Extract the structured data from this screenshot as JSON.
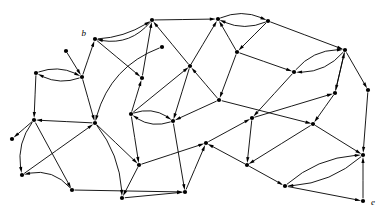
{
  "figure": {
    "type": "directed-graph-diagram",
    "background_color": "#ffffff",
    "ink_color": "#000000",
    "width": 388,
    "height": 218,
    "node_radius": 2.1,
    "arrow_length": 6.0,
    "arrow_width": 3.2,
    "stroke_width": 0.9
  },
  "labels": [
    {
      "id": "lbl-b",
      "text": "b",
      "node": "n01",
      "x": 86,
      "y": 36,
      "anchor": "end"
    },
    {
      "id": "lbl-e",
      "text": "e",
      "node": "n33",
      "x": 371,
      "y": 205,
      "anchor": "start"
    }
  ],
  "nodes": [
    {
      "id": "n01",
      "x": 95,
      "y": 39
    },
    {
      "id": "n02",
      "x": 152,
      "y": 20
    },
    {
      "id": "n03",
      "x": 218,
      "y": 19
    },
    {
      "id": "n04",
      "x": 268,
      "y": 21
    },
    {
      "id": "n05",
      "x": 36,
      "y": 73
    },
    {
      "id": "n06",
      "x": 82,
      "y": 77
    },
    {
      "id": "n07",
      "x": 142,
      "y": 78
    },
    {
      "id": "n08",
      "x": 190,
      "y": 66
    },
    {
      "id": "n09",
      "x": 237,
      "y": 52
    },
    {
      "id": "n10",
      "x": 294,
      "y": 72
    },
    {
      "id": "n11",
      "x": 345,
      "y": 50
    },
    {
      "id": "n12",
      "x": 34,
      "y": 120
    },
    {
      "id": "n13",
      "x": 95,
      "y": 123
    },
    {
      "id": "n14",
      "x": 131,
      "y": 114
    },
    {
      "id": "n15",
      "x": 173,
      "y": 121
    },
    {
      "id": "n16",
      "x": 219,
      "y": 100
    },
    {
      "id": "n17",
      "x": 252,
      "y": 118
    },
    {
      "id": "n18",
      "x": 335,
      "y": 93
    },
    {
      "id": "n19",
      "x": 368,
      "y": 90
    },
    {
      "id": "n20",
      "x": 313,
      "y": 124
    },
    {
      "id": "n21",
      "x": 22,
      "y": 175
    },
    {
      "id": "n22",
      "x": 72,
      "y": 190
    },
    {
      "id": "n23",
      "x": 139,
      "y": 165
    },
    {
      "id": "n24",
      "x": 122,
      "y": 198
    },
    {
      "id": "n25",
      "x": 185,
      "y": 192
    },
    {
      "id": "n26",
      "x": 206,
      "y": 143
    },
    {
      "id": "n27",
      "x": 247,
      "y": 165
    },
    {
      "id": "n28",
      "x": 285,
      "y": 186
    },
    {
      "id": "n29",
      "x": 363,
      "y": 155
    },
    {
      "id": "n30",
      "x": 66,
      "y": 51
    },
    {
      "id": "n31",
      "x": 12,
      "y": 139
    },
    {
      "id": "n32",
      "x": 162,
      "y": 47
    },
    {
      "id": "n33",
      "x": 363,
      "y": 201
    }
  ],
  "edges": [
    {
      "from": "n02",
      "to": "n01",
      "curve": -20
    },
    {
      "from": "n01",
      "to": "n02",
      "curve": 9
    },
    {
      "from": "n02",
      "to": "n03",
      "curve": 0
    },
    {
      "from": "n03",
      "to": "n04",
      "curve": -13
    },
    {
      "from": "n04",
      "to": "n03",
      "curve": -13
    },
    {
      "from": "n05",
      "to": "n06",
      "curve": -12
    },
    {
      "from": "n06",
      "to": "n05",
      "curve": -12
    },
    {
      "from": "n06",
      "to": "n01",
      "curve": 0
    },
    {
      "from": "n01",
      "to": "n07",
      "curve": 0
    },
    {
      "from": "n07",
      "to": "n02",
      "curve": 0
    },
    {
      "from": "n08",
      "to": "n02",
      "curve": 0
    },
    {
      "from": "n08",
      "to": "n03",
      "curve": 0
    },
    {
      "from": "n09",
      "to": "n03",
      "curve": 0
    },
    {
      "from": "n04",
      "to": "n09",
      "curve": 0
    },
    {
      "from": "n04",
      "to": "n11",
      "curve": 0
    },
    {
      "from": "n09",
      "to": "n10",
      "curve": 0
    },
    {
      "from": "n10",
      "to": "n11",
      "curve": -15
    },
    {
      "from": "n11",
      "to": "n10",
      "curve": -15
    },
    {
      "from": "n05",
      "to": "n12",
      "curve": 0
    },
    {
      "from": "n06",
      "to": "n13",
      "curve": 0
    },
    {
      "from": "n14",
      "to": "n08",
      "curve": 0
    },
    {
      "from": "n14",
      "to": "n07",
      "curve": 0
    },
    {
      "from": "n14",
      "to": "n15",
      "curve": -13
    },
    {
      "from": "n15",
      "to": "n14",
      "curve": -13
    },
    {
      "from": "n08",
      "to": "n15",
      "curve": 0
    },
    {
      "from": "n16",
      "to": "n08",
      "curve": 0
    },
    {
      "from": "n09",
      "to": "n16",
      "curve": 0
    },
    {
      "from": "n16",
      "to": "n15",
      "curve": 0
    },
    {
      "from": "n10",
      "to": "n17",
      "curve": 0
    },
    {
      "from": "n11",
      "to": "n18",
      "curve": 0
    },
    {
      "from": "n11",
      "to": "n19",
      "curve": 0
    },
    {
      "from": "n18",
      "to": "n11",
      "curve": 0
    },
    {
      "from": "n18",
      "to": "n20",
      "curve": 0
    },
    {
      "from": "n17",
      "to": "n18",
      "curve": 0
    },
    {
      "from": "n12",
      "to": "n21",
      "curve": 14
    },
    {
      "from": "n12",
      "to": "n22",
      "curve": 0
    },
    {
      "from": "n13",
      "to": "n12",
      "curve": 0
    },
    {
      "from": "n13",
      "to": "n23",
      "curve": 0
    },
    {
      "from": "n21",
      "to": "n13",
      "curve": 0
    },
    {
      "from": "n22",
      "to": "n21",
      "curve": 18
    },
    {
      "from": "n13",
      "to": "n24",
      "curve": -14
    },
    {
      "from": "n14",
      "to": "n23",
      "curve": 0
    },
    {
      "from": "n23",
      "to": "n26",
      "curve": 0
    },
    {
      "from": "n15",
      "to": "n25",
      "curve": 0
    },
    {
      "from": "n23",
      "to": "n24",
      "curve": 0
    },
    {
      "from": "n24",
      "to": "n25",
      "curve": 0
    },
    {
      "from": "n25",
      "to": "n26",
      "curve": 0
    },
    {
      "from": "n26",
      "to": "n17",
      "curve": 0
    },
    {
      "from": "n20",
      "to": "n27",
      "curve": 0
    },
    {
      "from": "n27",
      "to": "n26",
      "curve": 0
    },
    {
      "from": "n27",
      "to": "n28",
      "curve": 0
    },
    {
      "from": "n28",
      "to": "n29",
      "curve": -16
    },
    {
      "from": "n29",
      "to": "n28",
      "curve": -16
    },
    {
      "from": "n19",
      "to": "n29",
      "curve": 0
    },
    {
      "from": "n20",
      "to": "n29",
      "curve": 0
    },
    {
      "from": "n33",
      "to": "n29",
      "curve": 0
    },
    {
      "from": "n28",
      "to": "n33",
      "curve": 0
    },
    {
      "from": "n30",
      "to": "n06",
      "curve": 0
    },
    {
      "from": "n12",
      "to": "n31",
      "curve": 0
    },
    {
      "from": "n32",
      "to": "n13",
      "curve": 28
    },
    {
      "from": "n22",
      "to": "n25",
      "curve": 0
    },
    {
      "from": "n17",
      "to": "n27",
      "curve": 0
    },
    {
      "from": "n16",
      "to": "n20",
      "curve": 0
    }
  ]
}
